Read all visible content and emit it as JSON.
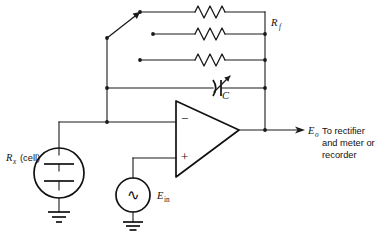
{
  "diagram": {
    "background_color": "#ffffff",
    "ink_color": "#1a1a1a"
  },
  "labels": {
    "feedback_resistor": "R",
    "feedback_resistor_sub": "f",
    "capacitor": "C",
    "cell_resistance": "R",
    "cell_resistance_sub": "x",
    "cell_note": "(cell)",
    "input_source": "E",
    "input_source_sub": "in",
    "output": "E",
    "output_sub": "o",
    "output_note_line1": "To rectifier",
    "output_note_line2": "and meter or",
    "output_note_line3": "recorder",
    "opamp_inverting": "−",
    "opamp_noninverting": "+",
    "ac_symbol": "∿"
  },
  "components": {
    "resistors": [
      {
        "name": "feedback-resistor-1",
        "row": 1
      },
      {
        "name": "feedback-resistor-2",
        "row": 2
      },
      {
        "name": "feedback-resistor-3",
        "row": 3
      }
    ],
    "variable_capacitor": {
      "name": "feedback-capacitor",
      "row": 4
    },
    "rotary_switch": {
      "name": "feedback-selector-switch",
      "positions": 3,
      "selected": 1
    },
    "op_amp": {
      "name": "operational-amplifier"
    },
    "cell": {
      "name": "measurement-cell"
    },
    "ac_source": {
      "name": "ac-input-source"
    },
    "grounds": [
      {
        "name": "ground-cell"
      },
      {
        "name": "ground-source"
      }
    ]
  }
}
